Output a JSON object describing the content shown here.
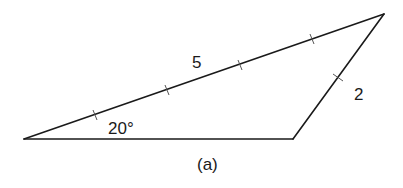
{
  "figure": {
    "caption": "(a)",
    "triangle": {
      "vertices": {
        "A": [
          24,
          139
        ],
        "B": [
          384,
          14
        ],
        "C": [
          293,
          139
        ]
      },
      "side_labels": {
        "AB": "5",
        "BC": "2"
      },
      "angle_label": "20°",
      "angle_at": "A"
    },
    "tick_marks": {
      "AB": 4,
      "BC": 1
    },
    "colors": {
      "line": "#1a1a1a",
      "background": "#ffffff"
    }
  }
}
